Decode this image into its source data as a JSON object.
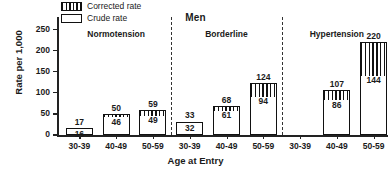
{
  "chart_data": {
    "type": "bar",
    "title": "Men",
    "xlabel": "Age at Entry",
    "ylabel": "Rate per 1,000",
    "ylim": [
      0,
      280
    ],
    "yticks": [
      0,
      50,
      100,
      150,
      200,
      250
    ],
    "grid": false,
    "legend_position": "top-left",
    "legend": [
      {
        "name": "Corrected rate",
        "pattern": "vertical-hatch"
      },
      {
        "name": "Crude rate",
        "pattern": "open"
      }
    ],
    "groups": [
      {
        "label": "Normotension",
        "categories": [
          "30-39",
          "40-49",
          "50-59"
        ],
        "corrected": [
          17,
          50,
          59
        ],
        "crude": [
          16,
          46,
          49
        ]
      },
      {
        "label": "Borderline",
        "categories": [
          "30-39",
          "40-49",
          "50-59"
        ],
        "corrected": [
          33,
          68,
          124
        ],
        "crude": [
          32,
          61,
          94
        ]
      },
      {
        "label": "Hypertension",
        "categories": [
          "30-39",
          "40-49",
          "50-59"
        ],
        "corrected": [
          null,
          107,
          220
        ],
        "crude": [
          null,
          86,
          144
        ]
      }
    ],
    "series": [
      {
        "name": "Corrected rate",
        "values": [
          17,
          50,
          59,
          33,
          68,
          124,
          null,
          107,
          220
        ]
      },
      {
        "name": "Crude rate",
        "values": [
          16,
          46,
          49,
          32,
          61,
          94,
          null,
          86,
          144
        ]
      }
    ],
    "categories": [
      "30-39",
      "40-49",
      "50-59",
      "30-39",
      "40-49",
      "50-59",
      "30-39",
      "40-49",
      "50-59"
    ]
  }
}
